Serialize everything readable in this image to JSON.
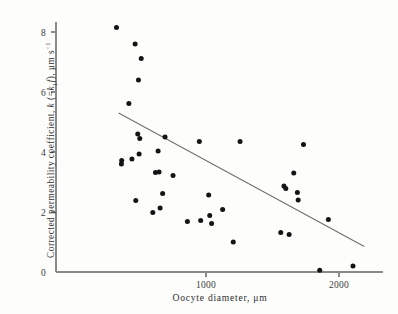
{
  "chart_data": {
    "type": "scatter",
    "title": "",
    "xlabel": "Oocyte diameter, μm",
    "ylabel": "Corrected permeability coefficient, k (=k₁f), μm s⁻¹",
    "ylabel_parts": {
      "lead": "Corrected permeability coefficient, ",
      "k_sym": "k",
      "paren_open": " (=",
      "k_sub_sym": "k",
      "k_sub_index": "1",
      "f_sym": "f",
      "paren_close": "), ",
      "unit": "μm s",
      "unit_exp": "−1"
    },
    "xlabel_parts": {
      "lead": "Oocyte diameter, ",
      "unit": "μm"
    },
    "xlim": [
      200,
      2200
    ],
    "ylim": [
      0,
      8.6
    ],
    "xticks": [
      1000,
      2000
    ],
    "xticklabels": [
      "1000",
      "2000"
    ],
    "yticks": [
      0,
      2,
      4,
      6,
      8
    ],
    "yticklabels": [
      "0",
      "2",
      "4",
      "6",
      "8"
    ],
    "grid": false,
    "legend": null,
    "marker": "filled-circle",
    "marker_color": "#141414",
    "axis_color": "#8a8a88",
    "trend_line_color": "#6f6f6d",
    "points": [
      {
        "x": 327,
        "y": 8.15
      },
      {
        "x": 467,
        "y": 7.6
      },
      {
        "x": 513,
        "y": 7.12
      },
      {
        "x": 492,
        "y": 6.4
      },
      {
        "x": 420,
        "y": 5.62
      },
      {
        "x": 487,
        "y": 4.6
      },
      {
        "x": 502,
        "y": 4.45
      },
      {
        "x": 692,
        "y": 4.5
      },
      {
        "x": 950,
        "y": 4.35
      },
      {
        "x": 1256,
        "y": 4.35
      },
      {
        "x": 1733,
        "y": 4.25
      },
      {
        "x": 640,
        "y": 4.03
      },
      {
        "x": 497,
        "y": 3.93
      },
      {
        "x": 443,
        "y": 3.77
      },
      {
        "x": 366,
        "y": 3.72
      },
      {
        "x": 364,
        "y": 3.6
      },
      {
        "x": 620,
        "y": 3.32
      },
      {
        "x": 647,
        "y": 3.33
      },
      {
        "x": 752,
        "y": 3.22
      },
      {
        "x": 1660,
        "y": 3.3
      },
      {
        "x": 1586,
        "y": 2.87
      },
      {
        "x": 1600,
        "y": 2.78
      },
      {
        "x": 1687,
        "y": 2.65
      },
      {
        "x": 674,
        "y": 2.62
      },
      {
        "x": 1020,
        "y": 2.57
      },
      {
        "x": 1693,
        "y": 2.4
      },
      {
        "x": 472,
        "y": 2.38
      },
      {
        "x": 1125,
        "y": 2.08
      },
      {
        "x": 655,
        "y": 2.13
      },
      {
        "x": 600,
        "y": 1.98
      },
      {
        "x": 1028,
        "y": 1.88
      },
      {
        "x": 1920,
        "y": 1.75
      },
      {
        "x": 860,
        "y": 1.68
      },
      {
        "x": 960,
        "y": 1.72
      },
      {
        "x": 1042,
        "y": 1.62
      },
      {
        "x": 1562,
        "y": 1.32
      },
      {
        "x": 1625,
        "y": 1.25
      },
      {
        "x": 1205,
        "y": 1.0
      },
      {
        "x": 1855,
        "y": 0.06
      },
      {
        "x": 2105,
        "y": 0.2
      }
    ],
    "trend_line": {
      "x_start": 343,
      "y_start": 5.3,
      "x_end": 2190,
      "y_end": 0.85
    }
  }
}
